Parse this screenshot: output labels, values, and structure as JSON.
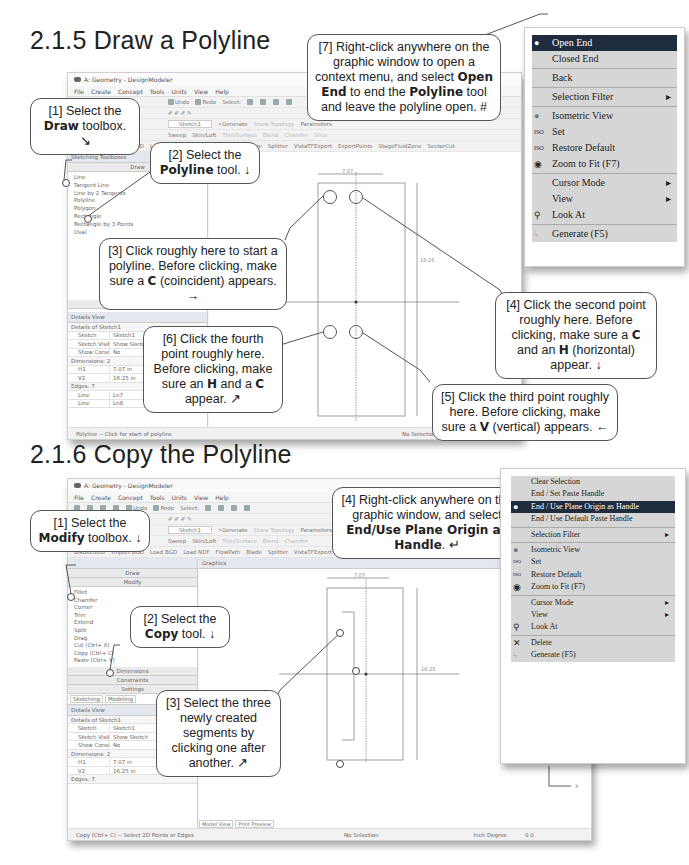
{
  "sections": [
    {
      "title": "2.1.5  Draw a Polyline",
      "window": {
        "title": "A: Geometry - DesignModeler",
        "menu": [
          "File",
          "Create",
          "Concept",
          "Tools",
          "Units",
          "View",
          "Help"
        ],
        "toolbar1": [
          "Undo",
          "Redo",
          "Select:"
        ],
        "toolbar2": [
          "Sketch1",
          "Generate",
          "Show Topology",
          "Parameters"
        ],
        "toolbar3": [
          "Sweep",
          "Skin/Loft",
          "Thin/Surface",
          "Blend",
          "Chamfer",
          "Slice"
        ],
        "toolbar4": [
          "BladeEditor",
          "Import BGD",
          "Load BGD",
          "Load NDF",
          "FlowPath",
          "Blade",
          "Splitter",
          "VistaTFExport",
          "ExportPoints",
          "StageFluidZone",
          "SectorCut"
        ],
        "panel_header": "Sketching Toolboxes",
        "toolbox": "Draw",
        "tools": [
          "Line",
          "Tangent Line",
          "Line by 2 Tangents",
          "Polyline",
          "Polygon",
          "Rectangle",
          "Rectangle by 3 Points",
          "Oval"
        ],
        "bottom_tab": "Sketching",
        "details_header": "Details View",
        "details": {
          "section1": "Details of Sketch1",
          "rows1": [
            [
              "Sketch",
              "Sketch1"
            ],
            [
              "Sketch Visibility",
              "Show Sketch"
            ],
            [
              "Show Constraints?",
              "No"
            ]
          ],
          "section2": "Dimensions: 2",
          "rows2": [
            [
              "H1",
              "7.07 in"
            ],
            [
              "V2",
              "16.25 in"
            ]
          ],
          "section3": "Edges: 7",
          "rows3": [
            [
              "Line",
              "Ln7"
            ],
            [
              "Line",
              "Ln8"
            ]
          ]
        },
        "status": "Polyline -- Click for start of polyline",
        "status_center": "No Selection",
        "dims": {
          "h": "7.07",
          "v": "16.25"
        }
      },
      "callouts": {
        "c1": {
          "pre": "[1] Select the ",
          "bold": "Draw",
          "post": " toolbox.  ↘"
        },
        "c2": {
          "pre": "[2] Select the ",
          "bold": "Polyline",
          "post": " tool.  ↓"
        },
        "c3": {
          "pre": "[3] Click roughly here to start a polyline.  Before clicking, make sure a ",
          "bold": "C",
          "post": " (coincident) appears.  →"
        },
        "c4": {
          "pre": "[4] Click the second point roughly here.  Before clicking, make sure a ",
          "bold": "C",
          "mid": " and an ",
          "bold2": "H",
          "post": " (horizontal) appear.  ↓"
        },
        "c5": {
          "pre": "[5] Click the third point roughly here.  Before clicking, make sure a ",
          "bold": "V",
          "post": " (vertical) appears.  ←"
        },
        "c6": {
          "pre": "[6] Click the fourth point roughly here.  Before clicking, make sure an ",
          "bold": "H",
          "mid": " and a ",
          "bold2": "C",
          "post": " appear.  ↗"
        },
        "c7": {
          "pre": "[7] Right-click anywhere on the graphic window to open a context menu, and select ",
          "bold": "Open End",
          "mid": " to end the ",
          "bold2": "Polyline",
          "post": " tool and leave the polyline open.  #"
        }
      },
      "context_menu": [
        {
          "label": "Open End",
          "selected": true
        },
        {
          "label": "Closed End"
        },
        {
          "sep": true
        },
        {
          "label": "Back"
        },
        {
          "sep": true
        },
        {
          "label": "Selection Filter",
          "submenu": true
        },
        {
          "sep": true
        },
        {
          "label": "Isometric View",
          "icon": "globe-icon"
        },
        {
          "label": "Set",
          "icon": "iso-set-icon"
        },
        {
          "label": "Restore Default",
          "icon": "iso-restore-icon"
        },
        {
          "label": "Zoom to Fit (F7)",
          "icon": "zoom-fit-icon"
        },
        {
          "sep": true
        },
        {
          "label": "Cursor Mode",
          "submenu": true
        },
        {
          "label": "View",
          "submenu": true
        },
        {
          "label": "Look At",
          "icon": "look-at-icon"
        },
        {
          "sep": true
        },
        {
          "label": "Generate (F5)",
          "icon": "generate-icon"
        }
      ]
    },
    {
      "title": "2.1.6  Copy the Polyline",
      "window": {
        "title": "A: Geometry - DesignModeler",
        "menu": [
          "File",
          "Create",
          "Concept",
          "Tools",
          "Units",
          "View",
          "Help"
        ],
        "toolbar1": [
          "Undo",
          "Redo",
          "Select:"
        ],
        "toolbar2": [
          "Sketch1",
          "Generate",
          "Show Topology",
          "Parameters"
        ],
        "toolbar3": [
          "Sweep",
          "Skin/Loft",
          "Thin/Surface",
          "Blend",
          "Chamfer"
        ],
        "toolbar4": [
          "BladeEditor",
          "Import BGD",
          "Load BGD",
          "Load NDF",
          "FlowPath",
          "Blade",
          "Splitter",
          "VistaTFExport",
          "ExportPoints",
          "StageFluidZone",
          "SectorCut"
        ],
        "graphics_label": "Graphics",
        "toolboxes": [
          "Draw",
          "Modify",
          "Dimensions",
          "Constraints",
          "Settings"
        ],
        "tools": [
          "Fillet",
          "Chamfer",
          "Corner",
          "Trim",
          "Extend",
          "Split",
          "Drag",
          "Cut (Ctrl+ X)",
          "Copy (Ctrl+ C)",
          "Paste (Ctrl+ V)"
        ],
        "tabs": [
          "Sketching",
          "Modeling"
        ],
        "details_header": "Details View",
        "details": {
          "section1": "Details of Sketch1",
          "rows1": [
            [
              "Sketch",
              "Sketch1"
            ],
            [
              "Sketch Visibility",
              "Show Sketch"
            ],
            [
              "Show Constraints?",
              "No"
            ]
          ],
          "section2": "Dimensions: 2",
          "rows2": [
            [
              "H1",
              "7.07 in"
            ],
            [
              "V2",
              "16.25 in"
            ]
          ],
          "section3": "Edges: 7"
        },
        "view_tabs": [
          "Model View",
          "Print Preview"
        ],
        "status": "Copy (Ctrl+ C) -- Select 2D Points or Edges",
        "status_center": "No Selection",
        "status_units": "Inch  Degree",
        "status_nums": "0    0",
        "dims": {
          "h": "7.07",
          "v": "16.25"
        },
        "axes": {
          "x": "X",
          "y": "Y"
        }
      },
      "callouts": {
        "c1": {
          "pre": "[1] Select the ",
          "bold": "Modify",
          "post": " toolbox.  ↓"
        },
        "c2": {
          "pre": "[2] Select the ",
          "bold": "Copy",
          "post": " tool.  ↓"
        },
        "c3": {
          "text": "[3] Select the three newly created segments by clicking one after another.  ↗"
        },
        "c4": {
          "pre": "[4] Right-click anywhere on the graphic window, and select ",
          "bold": "End/Use Plane Origin as Handle",
          "post": ".  ↵"
        }
      },
      "context_menu": [
        {
          "label": "Clear Selection"
        },
        {
          "label": "End / Set Paste Handle"
        },
        {
          "label": "End / Use Plane Origin as Handle",
          "selected": true
        },
        {
          "label": "End / Use Default Paste Handle"
        },
        {
          "sep": true
        },
        {
          "label": "Selection Filter",
          "submenu": true
        },
        {
          "sep": true
        },
        {
          "label": "Isometric View",
          "icon": "globe-icon"
        },
        {
          "label": "Set",
          "icon": "iso-set-icon"
        },
        {
          "label": "Restore Default",
          "icon": "iso-restore-icon"
        },
        {
          "label": "Zoom to Fit (F7)",
          "icon": "zoom-fit-icon"
        },
        {
          "sep": true
        },
        {
          "label": "Cursor Mode",
          "submenu": true
        },
        {
          "label": "View",
          "submenu": true
        },
        {
          "label": "Look At",
          "icon": "look-at-icon"
        },
        {
          "sep": true
        },
        {
          "label": "Delete",
          "icon": "delete-icon"
        },
        {
          "label": "Generate (F5)",
          "icon": "generate-icon"
        }
      ]
    }
  ]
}
